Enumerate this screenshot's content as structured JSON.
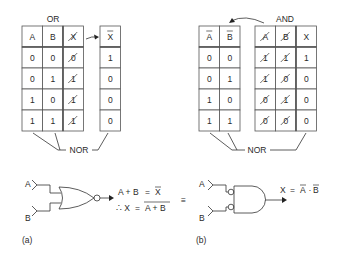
{
  "panel_a": {
    "caption": "(a)",
    "or_title": "OR",
    "or_table": {
      "headers": [
        "A",
        "B",
        "X"
      ],
      "struck_columns": [
        2
      ],
      "rows": [
        [
          "0",
          "0",
          "0"
        ],
        [
          "0",
          "1",
          "1"
        ],
        [
          "1",
          "0",
          "1"
        ],
        [
          "1",
          "1",
          "1"
        ]
      ]
    },
    "xbar_table": {
      "header": "X",
      "header_overbar": true,
      "rows": [
        "1",
        "0",
        "0",
        "0"
      ]
    },
    "nor_label": "NOR",
    "gate": {
      "type": "NOR",
      "input_a": "A",
      "input_b": "B"
    },
    "eq1": {
      "lhs": "A + B",
      "equals": "=",
      "rhs": "X",
      "rhs_overbar": true
    },
    "eq2": {
      "prefix": "∴ X",
      "equals": "=",
      "rhs": "A + B",
      "rhs_overbar": true
    }
  },
  "equivalence_symbol": "≡",
  "panel_b": {
    "caption": "(b)",
    "and_title": "AND",
    "bar_table": {
      "headers": [
        "A",
        "B"
      ],
      "header_overbar": true,
      "rows": [
        [
          "0",
          "0"
        ],
        [
          "0",
          "1"
        ],
        [
          "1",
          "0"
        ],
        [
          "1",
          "1"
        ]
      ]
    },
    "and_table": {
      "headers": [
        "A",
        "B",
        "X"
      ],
      "struck_columns": [
        0,
        1
      ],
      "rows": [
        [
          "1",
          "1",
          "1"
        ],
        [
          "1",
          "0",
          "0"
        ],
        [
          "0",
          "1",
          "0"
        ],
        [
          "0",
          "0",
          "0"
        ]
      ]
    },
    "nor_label": "NOR",
    "gate": {
      "type": "AND with inverted inputs",
      "input_a": "A",
      "input_b": "B"
    },
    "eq": {
      "lhs": "X",
      "equals": "=",
      "term1": "A",
      "dot": "·",
      "term2": "B",
      "terms_overbar": true
    }
  }
}
